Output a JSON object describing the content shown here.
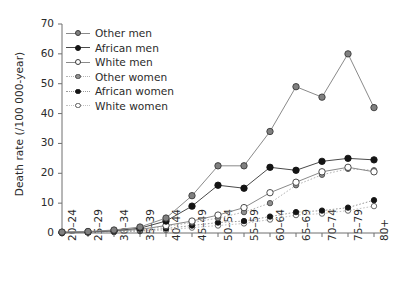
{
  "chart_data": {
    "type": "line",
    "title": "",
    "xlabel": "",
    "ylabel": "Death rate (/100 000-year)",
    "ylim": [
      0,
      70
    ],
    "yticks": [
      0,
      10,
      20,
      30,
      40,
      50,
      60,
      70
    ],
    "grid": false,
    "legend_position": "top-left inside",
    "categories": [
      "20–24",
      "25–29",
      "30–34",
      "35–39",
      "40–44",
      "45–49",
      "50–54",
      "55–59",
      "60–64",
      "65–69",
      "70–74",
      "75–79",
      "80+"
    ],
    "series": [
      {
        "name": "Other men",
        "marker": "gray-filled-circle",
        "marker_fill": "#808080",
        "marker_edge": "#3a3a3a",
        "line_color": "#8a8a8a",
        "line_style": "solid",
        "values": [
          0.3,
          0.5,
          1.0,
          2.0,
          5.0,
          12.5,
          22.5,
          22.5,
          34.0,
          49.0,
          45.5,
          60.0,
          42.0
        ]
      },
      {
        "name": "African men",
        "marker": "black-filled-circle",
        "marker_fill": "#141414",
        "marker_edge": "#141414",
        "line_color": "#4a4a4a",
        "line_style": "solid",
        "values": [
          0.2,
          0.4,
          0.8,
          1.6,
          4.0,
          9.0,
          16.0,
          15.0,
          22.0,
          21.0,
          24.0,
          25.0,
          24.5
        ]
      },
      {
        "name": "White men",
        "marker": "open-circle",
        "marker_fill": "#ffffff",
        "marker_edge": "#3a3a3a",
        "line_color": "#8a8a8a",
        "line_style": "solid",
        "values": [
          0.2,
          0.3,
          0.6,
          1.2,
          2.5,
          4.0,
          6.0,
          8.5,
          13.5,
          17.0,
          20.5,
          22.0,
          20.5
        ]
      },
      {
        "name": "Other women",
        "marker": "gray-filled-small-circle",
        "marker_fill": "#909090",
        "marker_edge": "#4a4a4a",
        "line_color": "#b5b5b5",
        "line_style": "dotted",
        "values": [
          0.2,
          0.3,
          0.6,
          1.2,
          2.2,
          3.5,
          5.0,
          7.0,
          10.0,
          16.0,
          19.5,
          21.5,
          21.0
        ]
      },
      {
        "name": "African women",
        "marker": "black-filled-small-circle",
        "marker_fill": "#141414",
        "marker_edge": "#141414",
        "line_color": "#9a9a9a",
        "line_style": "dotted",
        "values": [
          0.1,
          0.2,
          0.4,
          0.8,
          1.5,
          2.5,
          3.5,
          4.0,
          5.5,
          7.0,
          7.5,
          8.5,
          11.0
        ]
      },
      {
        "name": "White women",
        "marker": "open-small-circle",
        "marker_fill": "#ffffff",
        "marker_edge": "#5a5a5a",
        "line_color": "#c2c2c2",
        "line_style": "dotted",
        "values": [
          0.1,
          0.15,
          0.3,
          0.6,
          1.0,
          1.8,
          2.5,
          3.2,
          4.5,
          6.0,
          6.5,
          7.5,
          9.0
        ]
      }
    ]
  },
  "axes": {
    "y_tick_labels": [
      "0",
      "10",
      "20",
      "30",
      "40",
      "50",
      "60",
      "70"
    ],
    "y_axis_title": "Death rate (/100 000-year)",
    "x_tick_labels": [
      "20–24",
      "25–29",
      "30–34",
      "35–39",
      "40–44",
      "45–49",
      "50–54",
      "55–59",
      "60–64",
      "65–69",
      "70–74",
      "75–79",
      "80+"
    ]
  },
  "legend": {
    "items": [
      {
        "label": "Other men"
      },
      {
        "label": "African men"
      },
      {
        "label": "White men"
      },
      {
        "label": "Other women"
      },
      {
        "label": "African women"
      },
      {
        "label": "White women"
      }
    ]
  }
}
